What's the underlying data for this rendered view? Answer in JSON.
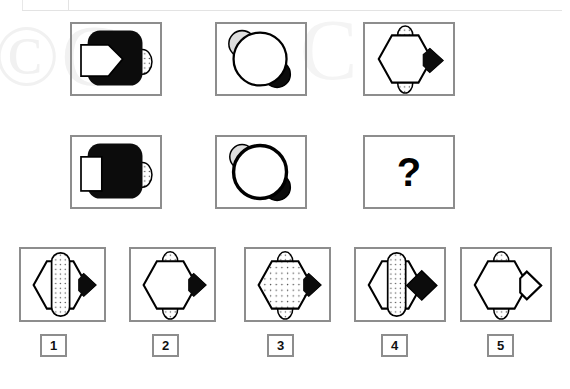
{
  "page": {
    "type": "non-verbal-reasoning-matrix-puzzle",
    "background_color": "#ffffff",
    "watermark_text": "©C",
    "watermark_text_2": "C"
  },
  "matrix": {
    "rows": 2,
    "columns": 3,
    "cells": [
      {
        "id": "r1c1",
        "description": "black rounded square with white arrow pentagon on left and small dotted ellipse on right edge",
        "shapes": [
          "rounded-square-black",
          "arrow-pentagon-white",
          "ellipse-dotted-small"
        ]
      },
      {
        "id": "r1c2",
        "description": "large white outlined circle with grey circle behind upper-left and black circle behind lower-right",
        "shapes": [
          "circle-white-outline",
          "circle-grey",
          "circle-black"
        ]
      },
      {
        "id": "r1c3",
        "description": "white hexagon with black diamond on right and small dotted ellipses top and bottom",
        "shapes": [
          "hexagon-white",
          "diamond-black",
          "ellipse-dotted-top",
          "ellipse-dotted-bottom"
        ]
      },
      {
        "id": "r2c1",
        "description": "black rounded square with white rectangle on left and small dotted ellipse on right edge",
        "shapes": [
          "rounded-square-black",
          "rectangle-white",
          "ellipse-dotted-small"
        ]
      },
      {
        "id": "r2c2",
        "description": "large white circle with thick outline, grey circle behind upper-left and black circle behind lower-right",
        "shapes": [
          "circle-white-thick-outline",
          "circle-grey",
          "circle-black"
        ]
      },
      {
        "id": "r2c3",
        "description": "missing tile marked with a question mark",
        "question_mark": "?"
      }
    ]
  },
  "options": {
    "count": 5,
    "items": [
      {
        "label": "1",
        "description": "hexagon with tall vertical dotted rounded capsule through the centre and black diamond behind at right",
        "hexagon_fill": "white",
        "centre_shape": "capsule-dotted-tall",
        "right_shape": "diamond-black-behind"
      },
      {
        "label": "2",
        "description": "white hexagon with black diamond behind at right and small dotted ellipses top and bottom",
        "hexagon_fill": "white",
        "centre_shape": "none",
        "right_shape": "diamond-black-behind"
      },
      {
        "label": "3",
        "description": "dotted filled hexagon with black diamond behind at right and small dotted ellipses top and bottom",
        "hexagon_fill": "dotted",
        "centre_shape": "none",
        "right_shape": "diamond-black-behind"
      },
      {
        "label": "4",
        "description": "hexagon with tall vertical dotted capsule through the centre and black diamond in front at right",
        "hexagon_fill": "white",
        "centre_shape": "capsule-dotted-tall",
        "right_shape": "diamond-black-front"
      },
      {
        "label": "5",
        "description": "white hexagon with unfilled white outlined diamond at right and small dotted ellipses top and bottom",
        "hexagon_fill": "white",
        "centre_shape": "none",
        "right_shape": "diamond-white-outline"
      }
    ]
  },
  "colors": {
    "box_border": "#8d8d8d",
    "shape_stroke": "#000000",
    "shape_black": "#0c0c0c",
    "shape_grey": "#dcdcdc",
    "dot_fill": "#fbfbfb",
    "watermark": "#f1f1f1"
  }
}
